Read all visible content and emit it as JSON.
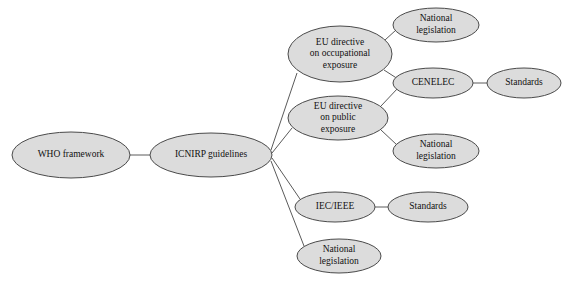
{
  "diagram": {
    "type": "node-link-tree",
    "title": "",
    "background_color": "#ffffff",
    "node_fill_color": "#dcdcdc",
    "node_stroke_color": "#4a4a4a",
    "edge_color": "#5a5a5a",
    "text_color": "#111111",
    "nodes": [
      {
        "id": "who",
        "label": "WHO framework",
        "lines": [
          "WHO framework"
        ],
        "cx": 71,
        "cy": 155,
        "rx": 59,
        "ry": 23
      },
      {
        "id": "icnirp",
        "label": "ICNIRP guidelines",
        "lines": [
          "ICNIRP guidelines"
        ],
        "cx": 211,
        "cy": 155,
        "rx": 61,
        "ry": 22
      },
      {
        "id": "eu-occupational",
        "label": "EU directive on occupational exposure",
        "lines": [
          "EU directive",
          "on occupational",
          "exposure"
        ],
        "cx": 340,
        "cy": 54,
        "rx": 52,
        "ry": 28
      },
      {
        "id": "eu-public",
        "label": "EU directive on public exposure",
        "lines": [
          "EU directive",
          "on public",
          "exposure"
        ],
        "cx": 338,
        "cy": 118,
        "rx": 50,
        "ry": 22
      },
      {
        "id": "iec-ieee",
        "label": "IEC/IEEE",
        "lines": [
          "IEC/IEEE"
        ],
        "cx": 335,
        "cy": 207,
        "rx": 40,
        "ry": 15
      },
      {
        "id": "national-bottom",
        "label": "National legislation",
        "lines": [
          "National",
          "legislation"
        ],
        "cx": 339,
        "cy": 256,
        "rx": 42,
        "ry": 17
      },
      {
        "id": "national-top",
        "label": "National legislation",
        "lines": [
          "National",
          "legislation"
        ],
        "cx": 436,
        "cy": 25,
        "rx": 43,
        "ry": 17
      },
      {
        "id": "cenelec",
        "label": "CENELEC",
        "lines": [
          "CENELEC"
        ],
        "cx": 433,
        "cy": 83,
        "rx": 40,
        "ry": 15
      },
      {
        "id": "standards-top",
        "label": "Standards",
        "lines": [
          "Standards"
        ],
        "cx": 524,
        "cy": 83,
        "rx": 37,
        "ry": 15
      },
      {
        "id": "national-middle",
        "label": "National legislation",
        "lines": [
          "National",
          "legislation"
        ],
        "cx": 436,
        "cy": 151,
        "rx": 43,
        "ry": 17
      },
      {
        "id": "standards-bottom",
        "label": "Standards",
        "lines": [
          "Standards"
        ],
        "cx": 428,
        "cy": 207,
        "rx": 40,
        "ry": 15
      }
    ],
    "edges": [
      {
        "id": "e-who-icnirp",
        "from": "who",
        "to": "icnirp",
        "x1": 130,
        "y1": 155,
        "x2": 150,
        "y2": 155
      },
      {
        "id": "e-icnirp-occupational",
        "from": "icnirp",
        "to": "eu-occupational",
        "x1": 271,
        "y1": 150,
        "x2": 297,
        "y2": 73
      },
      {
        "id": "e-icnirp-public",
        "from": "icnirp",
        "to": "eu-public",
        "x1": 272,
        "y1": 153,
        "x2": 292,
        "y2": 128
      },
      {
        "id": "e-icnirp-iec",
        "from": "icnirp",
        "to": "iec-ieee",
        "x1": 272,
        "y1": 158,
        "x2": 300,
        "y2": 199
      },
      {
        "id": "e-icnirp-national-bottom",
        "from": "icnirp",
        "to": "national-bottom",
        "x1": 271,
        "y1": 161,
        "x2": 304,
        "y2": 246
      },
      {
        "id": "e-occupational-national-top",
        "from": "eu-occupational",
        "to": "national-top",
        "x1": 385,
        "y1": 40,
        "x2": 396,
        "y2": 30
      },
      {
        "id": "e-occupational-cenelec",
        "from": "eu-occupational",
        "to": "cenelec",
        "x1": 384,
        "y1": 70,
        "x2": 398,
        "y2": 79
      },
      {
        "id": "e-public-cenelec",
        "from": "eu-public",
        "to": "cenelec",
        "x1": 381,
        "y1": 106,
        "x2": 398,
        "y2": 88
      },
      {
        "id": "e-public-national-middle",
        "from": "eu-public",
        "to": "national-middle",
        "x1": 381,
        "y1": 130,
        "x2": 397,
        "y2": 145
      },
      {
        "id": "e-cenelec-standards",
        "from": "cenelec",
        "to": "standards-top",
        "x1": 473,
        "y1": 83,
        "x2": 487,
        "y2": 83
      },
      {
        "id": "e-iec-standards",
        "from": "iec-ieee",
        "to": "standards-bottom",
        "x1": 375,
        "y1": 207,
        "x2": 388,
        "y2": 207
      }
    ]
  }
}
